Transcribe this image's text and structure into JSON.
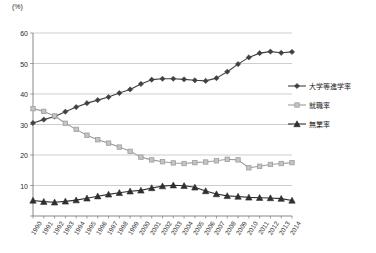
{
  "chart_data": {
    "type": "line",
    "title": "",
    "subtitle": "",
    "xlabel": "",
    "ylabel": "",
    "unit_label": "(%)",
    "grid": true,
    "legend_position": "right",
    "xlim": [
      1990,
      2014
    ],
    "ylim": [
      0,
      60
    ],
    "yticks": [
      0,
      10,
      20,
      30,
      40,
      50,
      60
    ],
    "ytick_labels": [
      "0",
      "10",
      "20",
      "30",
      "40",
      "50",
      "60"
    ],
    "categories": [
      "1990",
      "1991",
      "1992",
      "1993",
      "1994",
      "1995",
      "1996",
      "1997",
      "1998",
      "1999",
      "2000",
      "2001",
      "2002",
      "2003",
      "2004",
      "2005",
      "2006",
      "2007",
      "2008",
      "2009",
      "2010",
      "2011",
      "2012",
      "2013",
      "2014"
    ],
    "series": [
      {
        "name": "大学等進学率",
        "color": "#404040",
        "marker": "diamond",
        "values": [
          30.5,
          31.6,
          32.6,
          34.2,
          35.7,
          37.0,
          38.0,
          39.0,
          40.3,
          41.5,
          43.3,
          44.7,
          45.0,
          45.0,
          44.8,
          44.5,
          44.3,
          45.2,
          47.3,
          49.8,
          52.0,
          53.4,
          53.9,
          53.5,
          53.8
        ]
      },
      {
        "name": "就職率",
        "color": "#9d9d9d",
        "marker": "square",
        "values": [
          35.2,
          34.3,
          32.8,
          30.4,
          28.4,
          26.5,
          25.0,
          23.9,
          22.6,
          21.2,
          19.3,
          18.4,
          17.8,
          17.4,
          17.2,
          17.5,
          17.7,
          18.1,
          18.6,
          18.4,
          15.8,
          16.3,
          16.9,
          17.2,
          17.5
        ]
      },
      {
        "name": "無業率",
        "color": "#2f2f2f",
        "marker": "triangle",
        "values": [
          5.1,
          4.7,
          4.5,
          4.8,
          5.2,
          5.8,
          6.5,
          7.1,
          7.6,
          8.1,
          8.4,
          9.2,
          9.8,
          10.1,
          9.9,
          9.4,
          8.2,
          7.2,
          6.6,
          6.4,
          6.1,
          6.0,
          5.9,
          5.7,
          5.1
        ]
      }
    ]
  },
  "legend": {
    "items": [
      {
        "label": "大学等進学率"
      },
      {
        "label": "就職率"
      },
      {
        "label": "無業率"
      }
    ]
  }
}
